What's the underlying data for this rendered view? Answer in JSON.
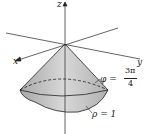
{
  "labels": {
    "z": "z",
    "x": "x",
    "y": "y",
    "phi_lhs": "φ =",
    "phi_num": "3π",
    "phi_den": "4",
    "rho": "ρ = 1"
  },
  "colors": {
    "cone_fill": "#c8c8c8",
    "line": "#222222"
  }
}
